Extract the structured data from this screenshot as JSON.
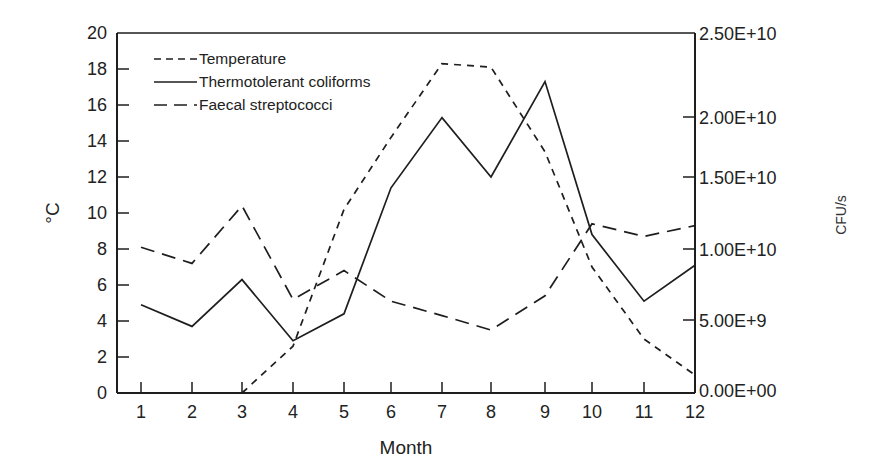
{
  "chart_data": {
    "type": "line",
    "title": "",
    "xlabel": "Month",
    "ylabel": "°C",
    "ylabel_right": "CFU/s",
    "x": [
      1,
      2,
      3,
      4,
      5,
      6,
      7,
      8,
      9,
      10,
      11,
      12
    ],
    "xticks": [
      "1",
      "2",
      "3",
      "4",
      "5",
      "6",
      "7",
      "8",
      "9",
      "10",
      "11",
      "12"
    ],
    "ylim": [
      0,
      20
    ],
    "yticks": [
      "0",
      "2",
      "4",
      "6",
      "8",
      "10",
      "12",
      "14",
      "16",
      "18",
      "20"
    ],
    "ylim_right": [
      0,
      25000000000.0
    ],
    "yticks_right": [
      "0.00E+00",
      "5.00E+9",
      "1.00E+10",
      "1.50E+10",
      "2.00E+10",
      "2.50E+10"
    ],
    "grid": false,
    "legend_position": "upper left (inside)",
    "series": [
      {
        "name": "Temperature",
        "axis": "left",
        "style": "short-dash",
        "x": [
          3,
          4,
          5,
          6,
          7,
          8,
          9,
          10,
          11,
          12
        ],
        "values": [
          0.0,
          2.6,
          10.2,
          14.2,
          18.3,
          18.1,
          13.4,
          7.0,
          3.0,
          1.0
        ],
        "units": "°C"
      },
      {
        "name": "Thermotolerant coliforms",
        "axis": "right",
        "style": "solid",
        "x": [
          1,
          2,
          3,
          4,
          5,
          6,
          7,
          8,
          9,
          10,
          11,
          12
        ],
        "values_plot_scale": [
          4.9,
          3.7,
          6.3,
          2.9,
          4.4,
          11.4,
          15.3,
          12.0,
          17.3,
          8.8,
          5.1,
          7.1
        ],
        "values": [
          6100000000.0,
          4600000000.0,
          7900000000.0,
          3600000000.0,
          5500000000.0,
          14300000000.0,
          19100000000.0,
          15000000000.0,
          21600000000.0,
          11000000000.0,
          6400000000.0,
          8900000000.0
        ],
        "units": "CFU/s"
      },
      {
        "name": "Faecal streptococci",
        "axis": "right",
        "style": "long-dash",
        "x": [
          1,
          2,
          3,
          4,
          5,
          6,
          7,
          8,
          9,
          10,
          11,
          12
        ],
        "values_plot_scale": [
          8.1,
          7.2,
          10.4,
          5.2,
          6.8,
          5.1,
          4.3,
          3.5,
          5.4,
          9.4,
          8.7,
          9.3
        ],
        "values": [
          10100000000.0,
          9000000000.0,
          13000000000.0,
          6500000000.0,
          8500000000.0,
          6400000000.0,
          5400000000.0,
          4400000000.0,
          6800000000.0,
          11800000000.0,
          10900000000.0,
          11600000000.0
        ],
        "units": "CFU/s"
      }
    ]
  },
  "legend": {
    "items": [
      {
        "label": "Temperature",
        "style": "short-dash"
      },
      {
        "label": "Thermotolerant coliforms",
        "style": "solid"
      },
      {
        "label": "Faecal streptococci",
        "style": "long-dash"
      }
    ]
  },
  "colors": {
    "line": "#1e1e1e",
    "background": "#ffffff"
  }
}
